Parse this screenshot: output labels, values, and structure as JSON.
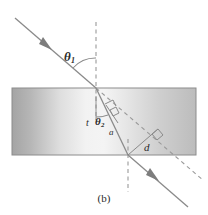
{
  "figure": {
    "caption": "(b)",
    "kind": "optics-refraction-slab-diagram",
    "labels": {
      "theta1": {
        "symbol": "θ",
        "subscript": "1",
        "meaning": "angle-of-incidence"
      },
      "theta2": {
        "symbol": "θ",
        "subscript": "2",
        "meaning": "angle-of-refraction"
      },
      "t": {
        "symbol": "t",
        "meaning": "slab-thickness"
      },
      "a": {
        "symbol": "a",
        "meaning": "path-length-in-slab"
      },
      "d": {
        "symbol": "d",
        "meaning": "lateral-displacement"
      }
    },
    "slab": {
      "x": 12,
      "y": 88,
      "width": 184,
      "height": 67,
      "fill_left": "#a6a6a6",
      "fill_mid": "#f2f2f2",
      "fill_right": "#bdbdbd",
      "border_color": "#8c8c8c"
    },
    "colors": {
      "background": "#ffffff",
      "ray": "#8a8a8a",
      "dashed": "#9a9a9a",
      "text": "#2b2b2b",
      "arc": "#8a8a8a"
    },
    "geometry": {
      "incident_ray": {
        "x1": 15,
        "y1": 18,
        "x2": 96,
        "y2": 88
      },
      "refracted_ray": {
        "x1": 96,
        "y1": 88,
        "x2": 128,
        "y2": 155
      },
      "exit_ray": {
        "x1": 128,
        "y1": 155,
        "x2": 186,
        "y2": 205
      },
      "normal_top": {
        "x": 96,
        "y1": 22,
        "y2": 120
      },
      "normal_bottom": {
        "x": 128,
        "y1": 139,
        "y2": 192
      },
      "extension_line": {
        "x1": 96,
        "y1": 88,
        "x2": 204,
        "y2": 181
      },
      "segment_a": {
        "x1": 110,
        "y1": 112,
        "x2": 117,
        "y2": 122
      },
      "segment_d": {
        "x1": 128,
        "y1": 155,
        "x2": 157,
        "y2": 130
      },
      "arrow_incident": {
        "x": 46,
        "y": 45
      },
      "arrow_exit": {
        "x": 152,
        "y": 176
      }
    }
  }
}
